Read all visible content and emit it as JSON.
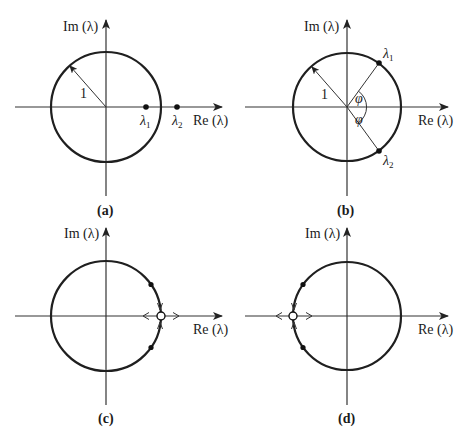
{
  "figure": {
    "panels": [
      {
        "id": "a",
        "caption": "(a)",
        "axis_x_label": "Re (λ)",
        "axis_y_label": "Im (λ)",
        "radius_label": "1",
        "points": [
          {
            "label": "λ",
            "sub": "1",
            "position": "inside unit circle on positive real axis"
          },
          {
            "label": "λ",
            "sub": "2",
            "position": "outside unit circle on positive real axis"
          }
        ]
      },
      {
        "id": "b",
        "caption": "(b)",
        "axis_x_label": "Re (λ)",
        "axis_y_label": "Im (λ)",
        "radius_label": "1",
        "angle_label": "φ",
        "points": [
          {
            "label": "λ",
            "sub": "1",
            "position": "on unit circle at angle +φ"
          },
          {
            "label": "λ",
            "sub": "2",
            "position": "on unit circle at angle −φ"
          }
        ]
      },
      {
        "id": "c",
        "caption": "(c)",
        "axis_x_label": "Re (λ)",
        "axis_y_label": "Im (λ)",
        "description": "conjugate pair on unit circle converging to λ = +1, then splitting along real axis"
      },
      {
        "id": "d",
        "caption": "(d)",
        "axis_x_label": "Re (λ)",
        "axis_y_label": "Im (λ)",
        "description": "conjugate pair on unit circle converging to λ = −1, then splitting along real axis"
      }
    ],
    "colors": {
      "line": "#1f1f1f",
      "axis": "#333333",
      "background": "#ffffff"
    }
  }
}
